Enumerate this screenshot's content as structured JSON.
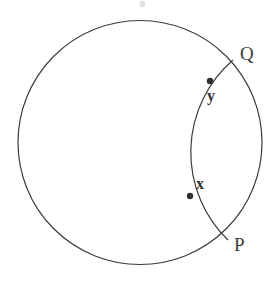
{
  "figure": {
    "kind": "geometry-diagram",
    "background_color": "#ffffff",
    "stroke_color": "#3c3c3c",
    "stroke_width": 1.2,
    "marker_color": "#2f2f2f",
    "label_color": "#3c3c3c",
    "width": 280,
    "height": 289
  },
  "chart_data": {
    "type": "scatter",
    "title": "",
    "xlabel": "",
    "ylabel": "",
    "grid": false,
    "legend": false,
    "shapes": [
      {
        "name": "outer-circle",
        "type": "circle",
        "center_x": 140,
        "center_y": 142.5,
        "radius": 122,
        "fill": "none",
        "stroke": "#3c3c3c"
      },
      {
        "name": "inner-arc",
        "type": "arc",
        "start_x": 233,
        "start_y": 60,
        "end_x": 228,
        "end_y": 240,
        "radius": 122,
        "sweep": 1,
        "large_arc": 0,
        "bulge_direction": "left",
        "leftmost_x": 177,
        "leftmost_y": 150,
        "fill": "none",
        "stroke": "#3c3c3c"
      }
    ],
    "points": [
      {
        "label": "Q",
        "x": 233,
        "y": 60,
        "marker": "none",
        "label_x": 245,
        "label_y": 54,
        "on": "outer-circle"
      },
      {
        "label": "P",
        "x": 228,
        "y": 240,
        "marker": "none",
        "label_x": 239,
        "label_y": 245,
        "on": "outer-circle"
      },
      {
        "label": "y",
        "x": 210,
        "y": 81,
        "marker": "dot",
        "marker_radius": 3.2,
        "label_x": 212,
        "label_y": 96,
        "on": "inner-arc"
      },
      {
        "label": "x",
        "x": 190,
        "y": 196,
        "marker": "dot",
        "marker_radius": 3.2,
        "label_x": 201,
        "label_y": 184,
        "on": "inner-arc"
      }
    ]
  },
  "labels": {
    "Q": "Q",
    "P": "P",
    "x": "x",
    "y": "y"
  }
}
